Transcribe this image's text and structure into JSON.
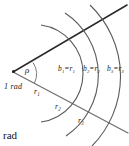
{
  "figure": {
    "caption": "rad",
    "angle_label": "ρ",
    "angle_value_label": "1 rad",
    "vertex_marker": "vertex-dot",
    "arc_length_labels": [
      {
        "text": "b",
        "sub": "1",
        "eq": "=",
        "rhs": "r",
        "rhs_sub": "1",
        "full": "b₁=r₁"
      },
      {
        "text": "b",
        "sub": "2",
        "eq": "=",
        "rhs": "r",
        "rhs_sub": "2",
        "full": "b₂=r₂"
      },
      {
        "text": "b",
        "sub": "3",
        "eq": "=",
        "rhs": "r",
        "rhs_sub": "3",
        "full": "b₃=r₃"
      }
    ],
    "radius_labels": [
      {
        "text": "r",
        "sub": "1",
        "full": "r₁"
      },
      {
        "text": "r",
        "sub": "2",
        "full": "r₂"
      },
      {
        "text": "r",
        "sub": "3",
        "full": "r₃"
      }
    ],
    "colors": {
      "ray_upper": "#2b2b2b",
      "ray_lower": "#6e6e6e",
      "arc": "#5a5a5a",
      "angle_arc": "#7a7a7a",
      "text": "#1a1a1a",
      "background": "#ffffff"
    }
  }
}
